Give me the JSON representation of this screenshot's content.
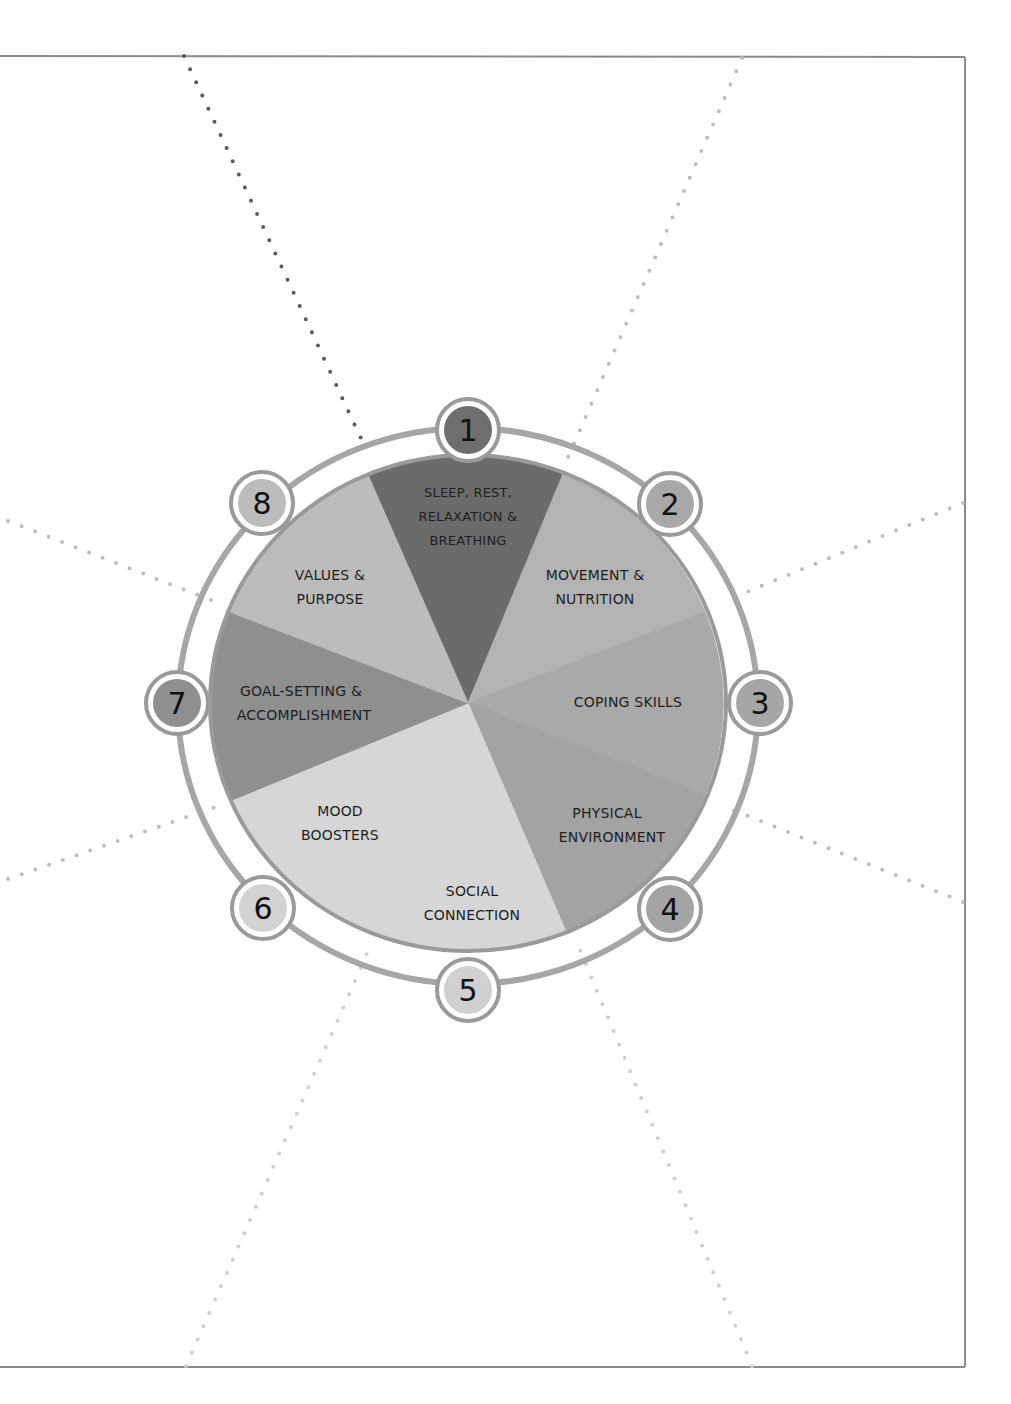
{
  "diagram": {
    "type": "wellness-wheel",
    "center": [
      468,
      703
    ],
    "colors": {
      "frame": "#8a8a8a",
      "ring": "#a6a6a6",
      "dots_dark": "#5a5a5a",
      "dots_light": "#bdbdbd",
      "badge_border": "#9a9a9a"
    },
    "segments": [
      {
        "number": "1",
        "label_lines": [
          "SLEEP, REST,",
          "RELAXATION &",
          "BREATHING"
        ],
        "color": "#6b6b6b",
        "badge_color": "#6e6e6e"
      },
      {
        "number": "2",
        "label_lines": [
          "MOVEMENT &",
          "NUTRITION"
        ],
        "color": "#b3b3b3",
        "badge_color": "#a8a8a8"
      },
      {
        "number": "3",
        "label_lines": [
          "COPING SKILLS"
        ],
        "color": "#a9a9a9",
        "badge_color": "#a6a6a6"
      },
      {
        "number": "4",
        "label_lines": [
          "PHYSICAL",
          "ENVIRONMENT"
        ],
        "color": "#a3a3a3",
        "badge_color": "#a4a4a4"
      },
      {
        "number": "5",
        "label_lines": [
          "SOCIAL",
          "CONNECTION"
        ],
        "color": "#d6d6d6",
        "badge_color": "#d0d0d0"
      },
      {
        "number": "6",
        "label_lines": [
          "MOOD",
          "BOOSTERS"
        ],
        "color": "#d6d6d6",
        "badge_color": "#d2d2d2"
      },
      {
        "number": "7",
        "label_lines": [
          "GOAL-SETTING &",
          "ACCOMPLISHMENT"
        ],
        "color": "#8f8f8f",
        "badge_color": "#8f8f8f"
      },
      {
        "number": "8",
        "label_lines": [
          "VALUES &",
          "PURPOSE"
        ],
        "color": "#bcbcbc",
        "badge_color": "#bcbcbc"
      }
    ]
  }
}
